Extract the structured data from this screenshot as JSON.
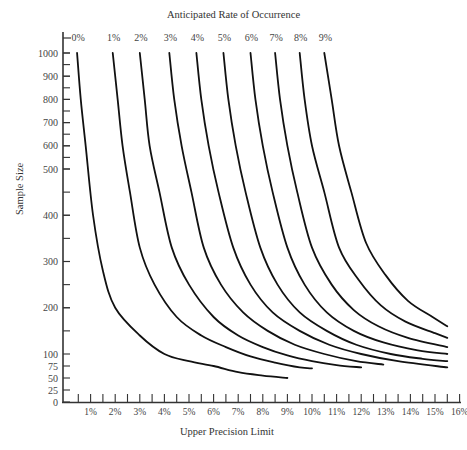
{
  "chart_data": {
    "type": "line",
    "title": "Anticipated Rate of Occurrence",
    "xlabel": "Upper Precision Limit",
    "ylabel": "Sample Size",
    "x_unit": "%",
    "xlim": [
      0,
      16
    ],
    "ylim": [
      0,
      1000
    ],
    "grid": false,
    "legend": "curve labels at top of each curve",
    "x_ticks": [
      "1%",
      "2%",
      "3%",
      "4%",
      "5%",
      "6%",
      "7%",
      "8%",
      "9%",
      "10%",
      "11%",
      "12%",
      "13%",
      "14%",
      "15%",
      "16%"
    ],
    "y_ticks": [
      "0",
      "25",
      "50",
      "75",
      "100",
      "200",
      "300",
      "400",
      "500",
      "600",
      "700",
      "800",
      "900",
      "1000"
    ],
    "series": [
      {
        "name": "0%",
        "points": [
          [
            0.45,
            1000
          ],
          [
            0.6,
            800
          ],
          [
            0.8,
            600
          ],
          [
            1.1,
            400
          ],
          [
            1.5,
            280
          ],
          [
            2.0,
            200
          ],
          [
            3.0,
            140
          ],
          [
            4.0,
            100
          ],
          [
            5.0,
            85
          ],
          [
            6.0,
            75
          ],
          [
            7.0,
            62
          ],
          [
            8.0,
            55
          ],
          [
            9.0,
            50
          ]
        ]
      },
      {
        "name": "1%",
        "points": [
          [
            1.9,
            1000
          ],
          [
            2.1,
            800
          ],
          [
            2.3,
            600
          ],
          [
            2.6,
            450
          ],
          [
            3.0,
            330
          ],
          [
            3.6,
            250
          ],
          [
            4.5,
            180
          ],
          [
            5.5,
            140
          ],
          [
            6.5,
            115
          ],
          [
            7.5,
            95
          ],
          [
            8.5,
            82
          ],
          [
            9.5,
            72
          ],
          [
            10.0,
            70
          ]
        ]
      },
      {
        "name": "2%",
        "points": [
          [
            3.0,
            1000
          ],
          [
            3.2,
            800
          ],
          [
            3.4,
            600
          ],
          [
            3.8,
            450
          ],
          [
            4.3,
            330
          ],
          [
            5.0,
            250
          ],
          [
            6.0,
            180
          ],
          [
            7.0,
            140
          ],
          [
            8.0,
            115
          ],
          [
            9.0,
            97
          ],
          [
            10.0,
            85
          ],
          [
            11.0,
            77
          ],
          [
            12.0,
            72
          ]
        ]
      },
      {
        "name": "3%",
        "points": [
          [
            4.2,
            1000
          ],
          [
            4.4,
            800
          ],
          [
            4.7,
            600
          ],
          [
            5.1,
            450
          ],
          [
            5.6,
            330
          ],
          [
            6.3,
            250
          ],
          [
            7.2,
            190
          ],
          [
            8.2,
            150
          ],
          [
            9.3,
            120
          ],
          [
            10.5,
            100
          ],
          [
            11.8,
            85
          ],
          [
            12.9,
            78
          ]
        ]
      },
      {
        "name": "4%",
        "points": [
          [
            5.3,
            1000
          ],
          [
            5.5,
            800
          ],
          [
            5.8,
            600
          ],
          [
            6.2,
            450
          ],
          [
            6.8,
            330
          ],
          [
            7.5,
            250
          ],
          [
            8.4,
            190
          ],
          [
            9.5,
            150
          ],
          [
            10.7,
            120
          ],
          [
            12.0,
            100
          ],
          [
            13.5,
            85
          ],
          [
            15.5,
            72
          ]
        ]
      },
      {
        "name": "5%",
        "points": [
          [
            6.4,
            1000
          ],
          [
            6.6,
            800
          ],
          [
            6.9,
            600
          ],
          [
            7.3,
            450
          ],
          [
            7.9,
            330
          ],
          [
            8.6,
            250
          ],
          [
            9.5,
            190
          ],
          [
            10.6,
            150
          ],
          [
            11.8,
            120
          ],
          [
            13.2,
            100
          ],
          [
            14.5,
            90
          ],
          [
            15.5,
            85
          ]
        ]
      },
      {
        "name": "6%",
        "points": [
          [
            7.5,
            1000
          ],
          [
            7.7,
            800
          ],
          [
            8.0,
            600
          ],
          [
            8.4,
            450
          ],
          [
            9.0,
            330
          ],
          [
            9.7,
            250
          ],
          [
            10.6,
            190
          ],
          [
            11.7,
            150
          ],
          [
            12.9,
            125
          ],
          [
            14.3,
            108
          ],
          [
            15.5,
            100
          ]
        ]
      },
      {
        "name": "7%",
        "points": [
          [
            8.5,
            1000
          ],
          [
            8.7,
            800
          ],
          [
            9.0,
            600
          ],
          [
            9.4,
            450
          ],
          [
            10.0,
            330
          ],
          [
            10.8,
            250
          ],
          [
            11.7,
            195
          ],
          [
            12.7,
            160
          ],
          [
            13.9,
            135
          ],
          [
            15.5,
            115
          ]
        ]
      },
      {
        "name": "8%",
        "points": [
          [
            9.5,
            1000
          ],
          [
            9.7,
            800
          ],
          [
            10.0,
            600
          ],
          [
            10.5,
            450
          ],
          [
            11.1,
            330
          ],
          [
            11.9,
            260
          ],
          [
            12.8,
            205
          ],
          [
            13.8,
            170
          ],
          [
            15.0,
            145
          ],
          [
            15.5,
            135
          ]
        ]
      },
      {
        "name": "9%",
        "points": [
          [
            10.5,
            1000
          ],
          [
            10.8,
            800
          ],
          [
            11.1,
            600
          ],
          [
            11.6,
            450
          ],
          [
            12.2,
            340
          ],
          [
            13.0,
            270
          ],
          [
            13.9,
            215
          ],
          [
            14.9,
            180
          ],
          [
            15.5,
            160
          ]
        ]
      }
    ]
  }
}
